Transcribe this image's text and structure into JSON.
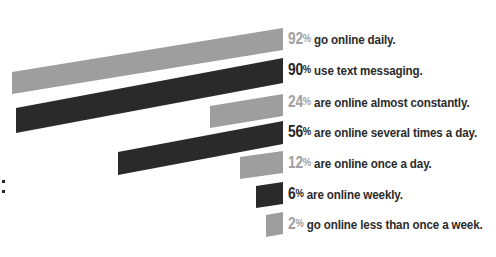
{
  "chart_data": {
    "type": "bar",
    "title": "",
    "subtitle": "",
    "xlabel": "",
    "ylabel": "",
    "orientation": "horizontal",
    "grid": false,
    "legend": "none",
    "xlim": [
      0,
      100
    ],
    "value_suffix": "%",
    "categories": [
      "go online daily.",
      "use text messaging.",
      "are online almost constantly.",
      "are online several times a day.",
      "are online once a day.",
      "are online weekly.",
      "go online less than once a week."
    ],
    "values": [
      92,
      90,
      24,
      56,
      12,
      6,
      2
    ],
    "colors": [
      "#9e9e9e",
      "#2a2a2a",
      "#9e9e9e",
      "#2a2a2a",
      "#9e9e9e",
      "#2a2a2a",
      "#9e9e9e"
    ],
    "palette": {
      "light": "#9e9e9e",
      "dark": "#2a2a2a",
      "text_light": "#a0a0a0",
      "text_dark": "#262626",
      "background": "#ffffff"
    },
    "bars": [
      {
        "index": 0,
        "value": 92,
        "value_label": "92",
        "percent_sign": "%",
        "description": "go online daily.",
        "tone": "light",
        "color": "#9e9e9e",
        "geometry": {
          "x_left": 12,
          "x_right": 283,
          "y_left_top": 72,
          "y_right_top": 28,
          "thickness": 22
        }
      },
      {
        "index": 1,
        "value": 90,
        "value_label": "90",
        "percent_sign": "%",
        "description": "use text messaging.",
        "tone": "dark",
        "color": "#2a2a2a",
        "geometry": {
          "x_left": 16,
          "x_right": 283,
          "y_left_top": 108,
          "y_right_top": 58,
          "thickness": 25
        }
      },
      {
        "index": 2,
        "value": 24,
        "value_label": "24",
        "percent_sign": "%",
        "description": "are online almost constantly.",
        "tone": "light",
        "color": "#9e9e9e",
        "geometry": {
          "x_left": 210,
          "x_right": 283,
          "y_left_top": 106,
          "y_right_top": 94,
          "thickness": 22
        }
      },
      {
        "index": 3,
        "value": 56,
        "value_label": "56",
        "percent_sign": "%",
        "description": "are online several times a day.",
        "tone": "dark",
        "color": "#2a2a2a",
        "geometry": {
          "x_left": 118,
          "x_right": 283,
          "y_left_top": 152,
          "y_right_top": 121,
          "thickness": 23
        }
      },
      {
        "index": 4,
        "value": 12,
        "value_label": "12",
        "percent_sign": "%",
        "description": "are online once a day.",
        "tone": "light",
        "color": "#9e9e9e",
        "geometry": {
          "x_left": 240,
          "x_right": 283,
          "y_left_top": 157,
          "y_right_top": 151,
          "thickness": 22
        }
      },
      {
        "index": 5,
        "value": 6,
        "value_label": "6",
        "percent_sign": "%",
        "description": "are online weekly.",
        "tone": "dark",
        "color": "#2a2a2a",
        "geometry": {
          "x_left": 256,
          "x_right": 283,
          "y_left_top": 186,
          "y_right_top": 182,
          "thickness": 22
        }
      },
      {
        "index": 6,
        "value": 2,
        "value_label": "2",
        "percent_sign": "%",
        "description": "go online less than once a week.",
        "tone": "light",
        "color": "#9e9e9e",
        "geometry": {
          "x_left": 266,
          "x_right": 283,
          "y_left_top": 215,
          "y_right_top": 212,
          "thickness": 22
        }
      }
    ]
  },
  "decoration": {
    "colon_mark": ":"
  }
}
